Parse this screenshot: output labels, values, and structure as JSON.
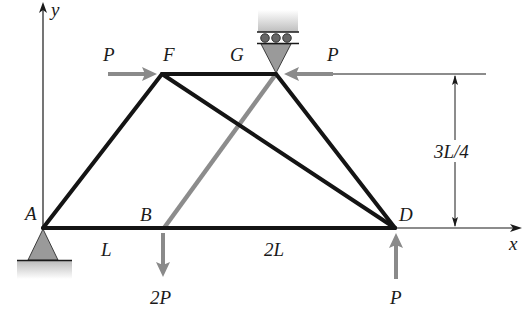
{
  "figure": {
    "type": "truss",
    "axes": {
      "x_label": "x",
      "y_label": "y"
    },
    "nodes": [
      {
        "id": "A",
        "label": "A",
        "support": "pin"
      },
      {
        "id": "B",
        "label": "B"
      },
      {
        "id": "D",
        "label": "D"
      },
      {
        "id": "F",
        "label": "F"
      },
      {
        "id": "G",
        "label": "G",
        "support": "roller (ceiling)"
      }
    ],
    "members": [
      {
        "from": "A",
        "to": "D",
        "style": "black"
      },
      {
        "from": "A",
        "to": "F",
        "style": "black"
      },
      {
        "from": "F",
        "to": "G",
        "style": "black"
      },
      {
        "from": "F",
        "to": "D",
        "style": "black"
      },
      {
        "from": "G",
        "to": "D",
        "style": "black"
      },
      {
        "from": "B",
        "to": "G",
        "style": "gray"
      }
    ],
    "loads": [
      {
        "at": "F",
        "label": "P",
        "direction": "right"
      },
      {
        "at": "G",
        "label": "P",
        "direction": "left"
      },
      {
        "at": "B",
        "label": "2P",
        "direction": "down"
      },
      {
        "at": "D",
        "label": "P",
        "direction": "up"
      }
    ],
    "dimensions": [
      {
        "label": "L",
        "span": "A-B"
      },
      {
        "label": "2L",
        "span": "B-D"
      },
      {
        "label": "3L/4",
        "span": "height"
      }
    ],
    "colors": {
      "member": "#141414",
      "gray_member": "#8c8c8c",
      "load_arrow": "#8a8a8a",
      "support_fill": "#9a9a9a",
      "ground_fill": "#c8c8c8"
    }
  },
  "labels": {
    "y_axis": "y",
    "x_axis": "x",
    "A": "A",
    "B": "B",
    "D": "D",
    "F": "F",
    "G": "G",
    "load_F": "P",
    "load_G": "P",
    "load_B": "2P",
    "load_D": "P",
    "dim_AB": "L",
    "dim_BD": "2L",
    "dim_height": "3L/4"
  }
}
